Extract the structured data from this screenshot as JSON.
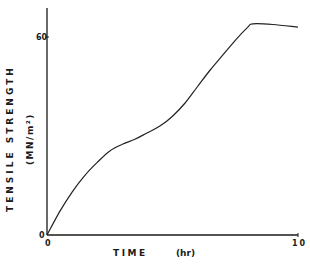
{
  "chart_data": {
    "type": "line",
    "title": "",
    "xlabel": "TIME",
    "xunit": "(hr)",
    "ylabel": "TENSILE STRENGTH",
    "yunit": "(MN/m²)",
    "xlim": [
      0,
      10
    ],
    "ylim": [
      0,
      68
    ],
    "x_ticks": [
      0,
      10
    ],
    "x_tick_labels": [
      "0",
      "10"
    ],
    "y_ticks": [
      0,
      60
    ],
    "y_tick_labels": [
      "0",
      "60"
    ],
    "grid": false,
    "legend": null,
    "series": [
      {
        "name": "tensile strength",
        "x": [
          0,
          0.5,
          1,
          1.5,
          2,
          2.5,
          3,
          3.5,
          4,
          4.5,
          5,
          5.5,
          6,
          6.5,
          7,
          7.5,
          8,
          8.2,
          9,
          10
        ],
        "values": [
          0,
          7,
          13,
          18,
          22,
          25.5,
          27.5,
          29,
          31,
          33,
          36,
          40,
          45,
          50,
          54.5,
          59,
          63,
          64,
          63.8,
          63
        ]
      }
    ]
  },
  "axes": {
    "x_label": "TIME",
    "x_unit": "(hr)",
    "y_label": "TENSILE STRENGTH",
    "y_unit": "(MN/m²)",
    "x_tick_0": "0",
    "x_tick_10": "10",
    "y_tick_0": "0",
    "y_tick_60": "60"
  }
}
